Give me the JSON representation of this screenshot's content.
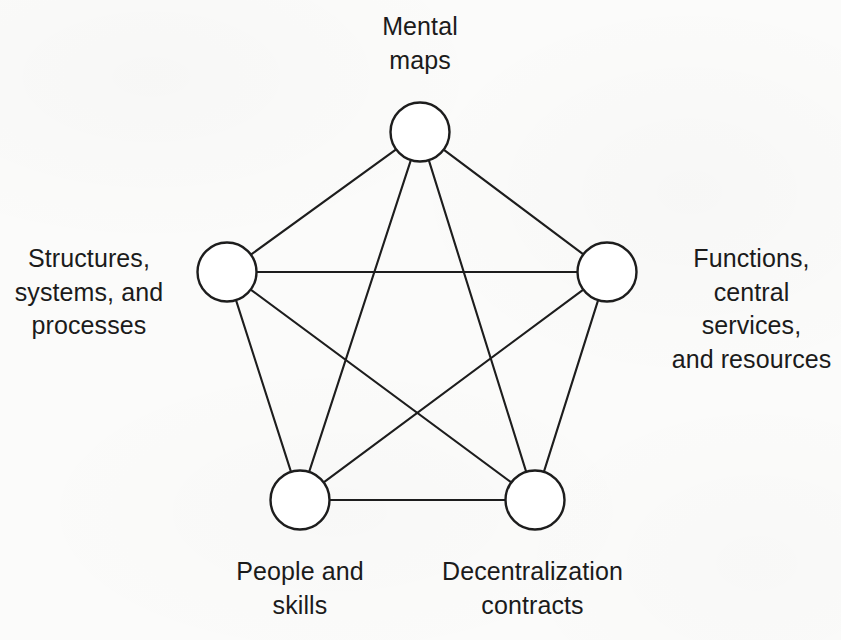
{
  "figure": {
    "kind": "node-link-diagram",
    "background_color": "#fbfbfa",
    "stroke_color": "#1d1d1d",
    "node_fill_color": "#ffffff",
    "text_color": "#1b1b1b"
  },
  "chart_data": {
    "type": "diagram",
    "title": "",
    "layout": "pentagon / complete-graph",
    "node_count": 5,
    "edge_count": 10,
    "nodes": [
      {
        "id": "mental-maps",
        "label": "Mental\nmaps",
        "cx": 420,
        "cy": 132,
        "r": 29.5,
        "label_position": "top"
      },
      {
        "id": "structures",
        "label": "Structures,\nsystems, and\nprocesses",
        "cx": 227,
        "cy": 272,
        "r": 29.5,
        "label_position": "left"
      },
      {
        "id": "functions",
        "label": "Functions,\ncentral services,\nand resources",
        "cx": 607,
        "cy": 272,
        "r": 29.5,
        "label_position": "right"
      },
      {
        "id": "people",
        "label": "People and\nskills",
        "cx": 300,
        "cy": 500,
        "r": 29.5,
        "label_position": "bottom-left"
      },
      {
        "id": "decentralization",
        "label": "Decentralization\ncontracts",
        "cx": 535,
        "cy": 500,
        "r": 29.5,
        "label_position": "bottom-right"
      }
    ],
    "edges": [
      {
        "from": "mental-maps",
        "to": "structures"
      },
      {
        "from": "mental-maps",
        "to": "functions"
      },
      {
        "from": "mental-maps",
        "to": "people"
      },
      {
        "from": "mental-maps",
        "to": "decentralization"
      },
      {
        "from": "structures",
        "to": "functions"
      },
      {
        "from": "structures",
        "to": "people"
      },
      {
        "from": "structures",
        "to": "decentralization"
      },
      {
        "from": "functions",
        "to": "people"
      },
      {
        "from": "functions",
        "to": "decentralization"
      },
      {
        "from": "people",
        "to": "decentralization"
      }
    ]
  },
  "labels": {
    "mental_maps": "Mental\nmaps",
    "structures": "Structures,\nsystems, and\nprocesses",
    "functions": "Functions,\ncentral services,\nand resources",
    "people": "People and\nskills",
    "decentralization": "Decentralization\ncontracts"
  }
}
